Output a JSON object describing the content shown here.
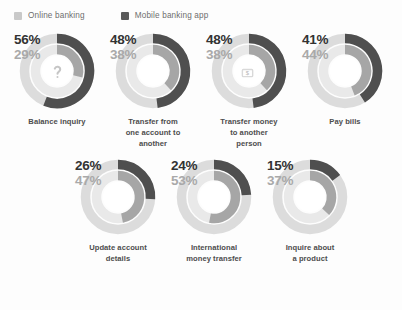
{
  "legend": {
    "items": [
      {
        "label": "Online banking",
        "color": "#c9c9c9",
        "series": "online"
      },
      {
        "label": "Mobile banking app",
        "color": "#5a5a5a",
        "series": "mobile"
      }
    ]
  },
  "colors": {
    "mobile_fill": "#4f4f4f",
    "mobile_track": "#dcdcdc",
    "online_fill": "#a6a6a6",
    "online_track": "#e9e9e9",
    "background": "#fdfdfd",
    "label_text": "#4d4d4d",
    "pct_primary_text": "#333333",
    "pct_secondary_text": "#a9a9a9"
  },
  "chart_data": {
    "type": "pie",
    "title": "",
    "subtitle": "",
    "xlabel": "",
    "ylabel": "",
    "legend_position": "top-left",
    "grid": false,
    "note": "Seven concentric double-donut gauges. Outer ring = Mobile banking app share, inner ring = Online banking share. Each arc starts at 12 o'clock and sweeps clockwise.",
    "categories": [
      "Balance inquiry",
      "Transfer from one account to another",
      "Transfer money to another person",
      "Pay bills",
      "Update account details",
      "International money transfer",
      "Inquire about a product"
    ],
    "series": [
      {
        "name": "Mobile banking app",
        "ring": "outer",
        "color": "#4f4f4f",
        "values": [
          56,
          48,
          48,
          41,
          26,
          24,
          15
        ]
      },
      {
        "name": "Online banking",
        "ring": "inner",
        "color": "#a6a6a6",
        "values": [
          29,
          38,
          38,
          44,
          47,
          53,
          37
        ]
      }
    ],
    "units": "percent",
    "ylim": [
      0,
      100
    ]
  },
  "charts": [
    {
      "id": "balance-inquiry",
      "label_lines": [
        "Balance inquiry"
      ],
      "label": "Balance inquiry",
      "mobile_pct": 56,
      "online_pct": 29,
      "mobile_pct_text": "56%",
      "online_pct_text": "29%",
      "icon": "question-mark-icon"
    },
    {
      "id": "transfer-between-accounts",
      "label_lines": [
        "Transfer from",
        "one account to",
        "another"
      ],
      "label": "Transfer from one account to another",
      "mobile_pct": 48,
      "online_pct": 38,
      "mobile_pct_text": "48%",
      "online_pct_text": "38%",
      "icon": "shuffle-arrows-icon"
    },
    {
      "id": "transfer-to-person",
      "label_lines": [
        "Transfer money",
        "to another",
        "person"
      ],
      "label": "Transfer money to another person",
      "mobile_pct": 48,
      "online_pct": 38,
      "mobile_pct_text": "48%",
      "online_pct_text": "38%",
      "icon": "banknotes-icon"
    },
    {
      "id": "pay-bills",
      "label_lines": [
        "Pay bills"
      ],
      "label": "Pay bills",
      "mobile_pct": 41,
      "online_pct": 44,
      "mobile_pct_text": "41%",
      "online_pct_text": "44%",
      "icon": "credit-card-icon"
    },
    {
      "id": "update-account-details",
      "label_lines": [
        "Update account",
        "details"
      ],
      "label": "Update account details",
      "mobile_pct": 26,
      "online_pct": 47,
      "mobile_pct_text": "26%",
      "online_pct_text": "47%",
      "icon": "document-edit-icon"
    },
    {
      "id": "international-money-transfer",
      "label_lines": [
        "International",
        "money transfer"
      ],
      "label": "International money transfer",
      "mobile_pct": 24,
      "online_pct": 53,
      "mobile_pct_text": "24%",
      "online_pct_text": "53%",
      "icon": "currency-exchange-icon"
    },
    {
      "id": "inquire-about-product",
      "label_lines": [
        "Inquire about",
        "a product"
      ],
      "label": "Inquire about a product",
      "mobile_pct": 15,
      "online_pct": 37,
      "mobile_pct_text": "15%",
      "online_pct_text": "37%",
      "icon": "open-box-icon"
    }
  ]
}
